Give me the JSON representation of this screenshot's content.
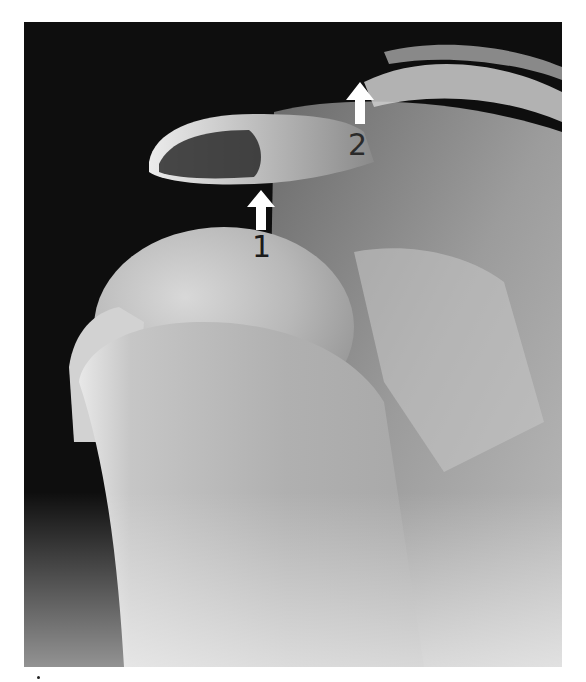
{
  "image": {
    "subject": "shoulder radiograph",
    "background_color": "#ffffff"
  },
  "annotations": [
    {
      "label": "1",
      "arrow": "white-up-arrow"
    },
    {
      "label": "2",
      "arrow": "white-up-arrow"
    }
  ]
}
